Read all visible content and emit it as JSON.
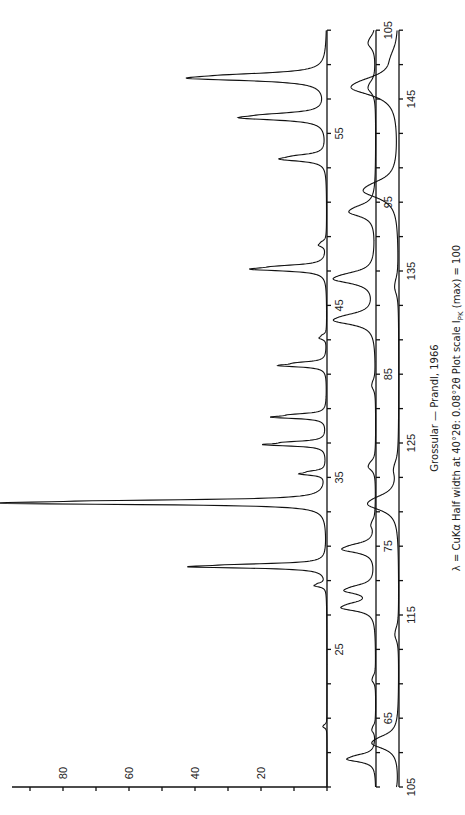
{
  "chart_data": {
    "type": "line",
    "orientation": "rotated-90-ccw",
    "title": "Grossular — Prandl, 1966",
    "subtitle": "λ = CuKα   Half width at 40°2θ: 0.08°2θ   Plot scale I_PK (max) = 100",
    "xlabel": "2θ (degrees)",
    "ylabel": "Intensity",
    "ylim": [
      0,
      100
    ],
    "intensity_ticks": [
      20,
      40,
      60,
      80
    ],
    "grid": false,
    "panels": [
      {
        "name": "panel-1",
        "range": [
          17,
          61
        ],
        "tick_labels": [
          25,
          35,
          45,
          55
        ]
      },
      {
        "name": "panel-2",
        "range": [
          61,
          105
        ],
        "tick_labels": [
          65,
          75,
          85,
          95,
          105
        ]
      },
      {
        "name": "panel-3",
        "range": [
          105,
          149
        ],
        "tick_labels": [
          105,
          115,
          125,
          135,
          145
        ]
      }
    ],
    "peaks": [
      {
        "two_theta": 20.5,
        "intensity": 1
      },
      {
        "two_theta": 28.7,
        "intensity": 3
      },
      {
        "two_theta": 29.8,
        "intensity": 36
      },
      {
        "two_theta": 33.5,
        "intensity": 90
      },
      {
        "two_theta": 35.2,
        "intensity": 7
      },
      {
        "two_theta": 36.9,
        "intensity": 17
      },
      {
        "two_theta": 38.5,
        "intensity": 15
      },
      {
        "two_theta": 41.5,
        "intensity": 13
      },
      {
        "two_theta": 43.1,
        "intensity": 2
      },
      {
        "two_theta": 47.1,
        "intensity": 20
      },
      {
        "two_theta": 48.5,
        "intensity": 2
      },
      {
        "two_theta": 53.5,
        "intensity": 12
      },
      {
        "two_theta": 55.9,
        "intensity": 22
      },
      {
        "two_theta": 58.2,
        "intensity": 35
      },
      {
        "two_theta": 62.6,
        "intensity": 8
      },
      {
        "two_theta": 64.3,
        "intensity": 1
      },
      {
        "two_theta": 67.2,
        "intensity": 1
      },
      {
        "two_theta": 71.4,
        "intensity": 9
      },
      {
        "two_theta": 72.4,
        "intensity": 8
      },
      {
        "two_theta": 74.8,
        "intensity": 9
      },
      {
        "two_theta": 76.2,
        "intensity": 1
      },
      {
        "two_theta": 79.6,
        "intensity": 2
      },
      {
        "two_theta": 84.3,
        "intensity": 1
      },
      {
        "two_theta": 88.1,
        "intensity": 11
      },
      {
        "two_theta": 90.5,
        "intensity": 11
      },
      {
        "two_theta": 94.4,
        "intensity": 7
      },
      {
        "two_theta": 101.6,
        "intensity": 2
      },
      {
        "two_theta": 104.2,
        "intensity": 2
      },
      {
        "two_theta": 107.5,
        "intensity": 7
      },
      {
        "two_theta": 113.8,
        "intensity": 1
      },
      {
        "two_theta": 121.4,
        "intensity": 8
      },
      {
        "two_theta": 123.4,
        "intensity": 1
      },
      {
        "two_theta": 134.0,
        "intensity": 1
      },
      {
        "two_theta": 139.6,
        "intensity": 9
      },
      {
        "two_theta": 145.6,
        "intensity": 12
      },
      {
        "two_theta": 147.3,
        "intensity": 1
      }
    ]
  },
  "captions": {
    "title": "Grossular — Prandl, 1966",
    "subtitle": "λ = CuKα   Half width at 40°2θ: 0.08°2θ   Plot scale I",
    "subtitle_sub": "PK",
    "subtitle_end": " (max) = 100"
  },
  "layout": {
    "px_per_degree": 17.2,
    "px_per_intensity": 3.3,
    "bottom_y": 787,
    "panel_baselines_x": [
      327,
      376,
      399
    ],
    "panel_offsets": [
      0.0,
      0.0,
      0.0
    ]
  }
}
